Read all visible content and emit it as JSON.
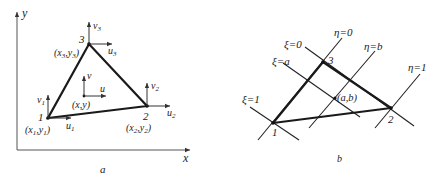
{
  "figure_a": {
    "caption": "a",
    "axes": {
      "x_label": "x",
      "y_label": "y"
    },
    "nodes": [
      {
        "id": "1",
        "coord_label": "(x1,y1)",
        "coord_x_sub": "1",
        "coord_y_sub": "1",
        "u_label": "u",
        "u_sub": "1",
        "v_label": "v",
        "v_sub": "1"
      },
      {
        "id": "2",
        "coord_label": "(x2,y2)",
        "coord_x_sub": "2",
        "coord_y_sub": "2",
        "u_label": "u",
        "u_sub": "2",
        "v_label": "v",
        "v_sub": "2"
      },
      {
        "id": "3",
        "coord_label": "(x3,y3)",
        "coord_x_sub": "3",
        "coord_y_sub": "3",
        "u_label": "u",
        "u_sub": "3",
        "v_label": "v",
        "v_sub": "3"
      }
    ],
    "interior_point": {
      "label": "(x,y)",
      "u_label": "u",
      "v_label": "v"
    }
  },
  "figure_b": {
    "caption": "b",
    "nodes": [
      {
        "id": "1"
      },
      {
        "id": "2"
      },
      {
        "id": "3"
      }
    ],
    "xi_lines": [
      {
        "label": "ξ=0",
        "sym": "ξ",
        "val": "0"
      },
      {
        "label": "ξ=a",
        "sym": "ξ",
        "val": "a"
      },
      {
        "label": "ξ=1",
        "sym": "ξ",
        "val": "1"
      }
    ],
    "eta_lines": [
      {
        "label": "η=0",
        "sym": "η",
        "val": "0"
      },
      {
        "label": "η=b",
        "sym": "η",
        "val": "b"
      },
      {
        "label": "η=1",
        "sym": "η",
        "val": "1"
      }
    ],
    "interior_point": {
      "label": "(a,b)"
    }
  }
}
